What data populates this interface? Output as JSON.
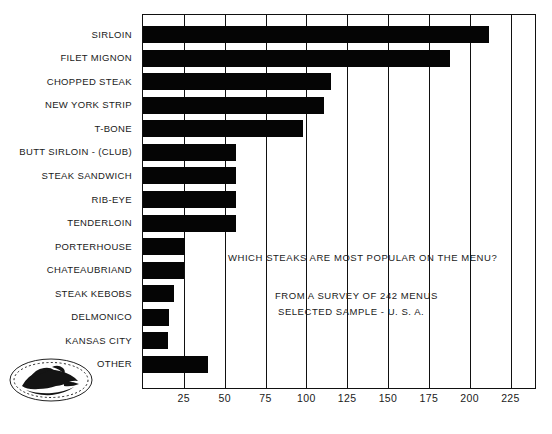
{
  "chart_data": {
    "type": "bar",
    "orientation": "horizontal",
    "title": "",
    "xlabel": "",
    "ylabel": "",
    "xlim": [
      0,
      240
    ],
    "grid": true,
    "legend": false,
    "categories": [
      "SIRLOIN",
      "FILET MIGNON",
      "CHOPPED STEAK",
      "NEW YORK STRIP",
      "T-BONE",
      "BUTT SIRLOIN - (CLUB)",
      "STEAK SANDWICH",
      "RIB-EYE",
      "TENDERLOIN",
      "PORTERHOUSE",
      "CHATEAUBRIAND",
      "STEAK KEBOBS",
      "DELMONICO",
      "KANSAS CITY",
      "OTHER"
    ],
    "values": [
      212,
      188,
      115,
      111,
      98,
      57,
      57,
      57,
      57,
      26,
      25,
      19,
      16,
      15,
      40
    ],
    "xticks": [
      25,
      50,
      75,
      100,
      125,
      150,
      175,
      200,
      225
    ],
    "bar_color": "#050505",
    "frame_color": "#111111"
  },
  "annotations": {
    "question": "WHICH STEAKS ARE MOST POPULAR ON THE MENU?",
    "source_line1": "FROM A SURVEY OF 242 MENUS",
    "source_line2": "SELECTED SAMPLE - U. S. A."
  },
  "logo": {
    "name": "steak-platter-logo"
  }
}
